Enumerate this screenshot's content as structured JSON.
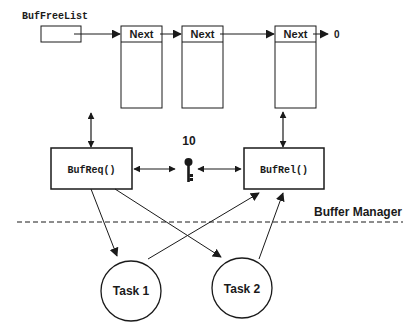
{
  "diagram": {
    "free_list_label": "BufFreeList",
    "list_nodes": [
      {
        "label": "Next"
      },
      {
        "label": "Next"
      },
      {
        "label": "Next"
      }
    ],
    "list_terminator": "0",
    "functions": {
      "request": "BufReq()",
      "release": "BufRel()"
    },
    "semaphore": {
      "count": "10",
      "icon": "key-icon"
    },
    "boundary_label": "Buffer Manager",
    "tasks": [
      {
        "label": "Task 1"
      },
      {
        "label": "Task 2"
      }
    ],
    "colors": {
      "stroke": "#1a1a1a",
      "background": "#ffffff"
    }
  }
}
